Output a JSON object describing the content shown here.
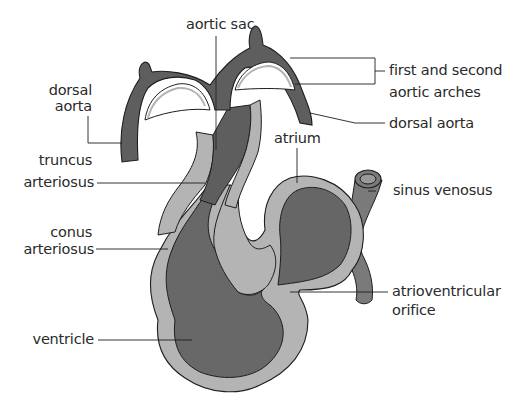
{
  "diagram": {
    "colors": {
      "dark": "#5e5e5e",
      "medium": "#7a7a7a",
      "light": "#b4b4b4",
      "outline": "#1e1e1e",
      "background": "#ffffff"
    },
    "labels": {
      "aortic_sac": "aortic sac",
      "dorsal_aorta_left_1": "dorsal",
      "dorsal_aorta_left_2": "aorta",
      "first_second_arches_1": "first and second",
      "first_second_arches_2": "aortic arches",
      "dorsal_aorta_right": "dorsal aorta",
      "truncus_1": "truncus",
      "truncus_2": "arteriosus",
      "atrium": "atrium",
      "sinus_venosus": "sinus venosus",
      "conus_1": "conus",
      "conus_2": "arteriosus",
      "atrioventricular_1": "atrioventricular",
      "atrioventricular_2": "orifice",
      "ventricle": "ventricle"
    }
  }
}
